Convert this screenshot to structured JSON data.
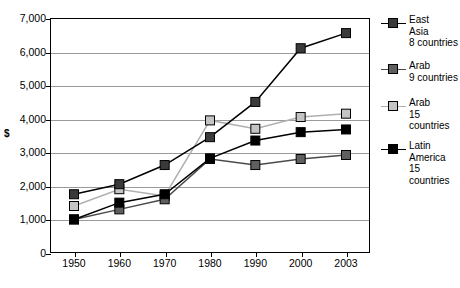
{
  "chart_data": {
    "type": "line",
    "title": "",
    "xlabel": "",
    "ylabel": "$",
    "ylim": [
      0,
      7000
    ],
    "ytick_labels": [
      "7,000",
      "6,000",
      "5,000",
      "4,000",
      "3,000",
      "2,000",
      "1,000",
      "0"
    ],
    "ytick_values": [
      7000,
      6000,
      5000,
      4000,
      3000,
      2000,
      1000,
      0
    ],
    "grid": true,
    "legend_position": "right",
    "categories": [
      "1950",
      "1960",
      "1970",
      "1980",
      "1990",
      "2000",
      "2003"
    ],
    "x": [
      1950,
      1960,
      1970,
      1980,
      1990,
      2000,
      2003
    ],
    "series": [
      {
        "name": "East Asia 8 countries",
        "legend_label": "East\nAsia\n8 countries",
        "color": "#3a3a3a",
        "line_color": "#000000",
        "values": [
          1750,
          2050,
          2620,
          3450,
          4500,
          6100,
          6550
        ]
      },
      {
        "name": "Arab 9 countries",
        "legend_label": "Arab\n9 countries",
        "color": "#5f5f5f",
        "line_color": "#4a4a4a",
        "values": [
          1000,
          1300,
          1600,
          2800,
          2620,
          2800,
          2920
        ]
      },
      {
        "name": "Arab 15 countries",
        "legend_label": "Arab\n15 countries",
        "color": "#c4c4c4",
        "line_color": "#b0b0b0",
        "values": [
          1400,
          1900,
          1700,
          3950,
          3700,
          4050,
          4150
        ]
      },
      {
        "name": "Latin America 15 countries",
        "legend_label": "Latin\nAmerica\n15 countries",
        "color": "#000000",
        "line_color": "#000000",
        "values": [
          1000,
          1500,
          1750,
          2820,
          3350,
          3600,
          3680
        ]
      }
    ]
  }
}
